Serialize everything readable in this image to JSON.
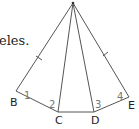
{
  "caption_fragment": "eles.",
  "diagram": {
    "apex": {
      "x": 73,
      "y": 3
    },
    "points": [
      {
        "label": "B",
        "x": 16,
        "y": 91
      },
      {
        "label": "C",
        "x": 58,
        "y": 112
      },
      {
        "label": "D",
        "x": 94,
        "y": 112
      },
      {
        "label": "E",
        "x": 129,
        "y": 97
      }
    ],
    "angle_labels": [
      "1",
      "2",
      "3",
      "4"
    ],
    "tick_marks": "sides apex-B and apex-E marked equal",
    "line_color": "#555555"
  }
}
